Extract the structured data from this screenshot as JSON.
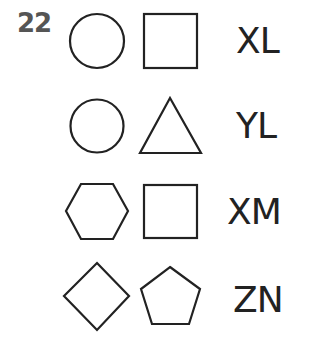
{
  "question": {
    "number": "22"
  },
  "rows": [
    {
      "shapes": [
        "circle",
        "square"
      ],
      "code": "XL"
    },
    {
      "shapes": [
        "circle",
        "triangle"
      ],
      "code": "YL"
    },
    {
      "shapes": [
        "hexagon",
        "square"
      ],
      "code": "XM"
    },
    {
      "shapes": [
        "diamond",
        "pentagon"
      ],
      "code": "ZN"
    }
  ],
  "colors": {
    "stroke": "#222222",
    "number": "#555555"
  }
}
